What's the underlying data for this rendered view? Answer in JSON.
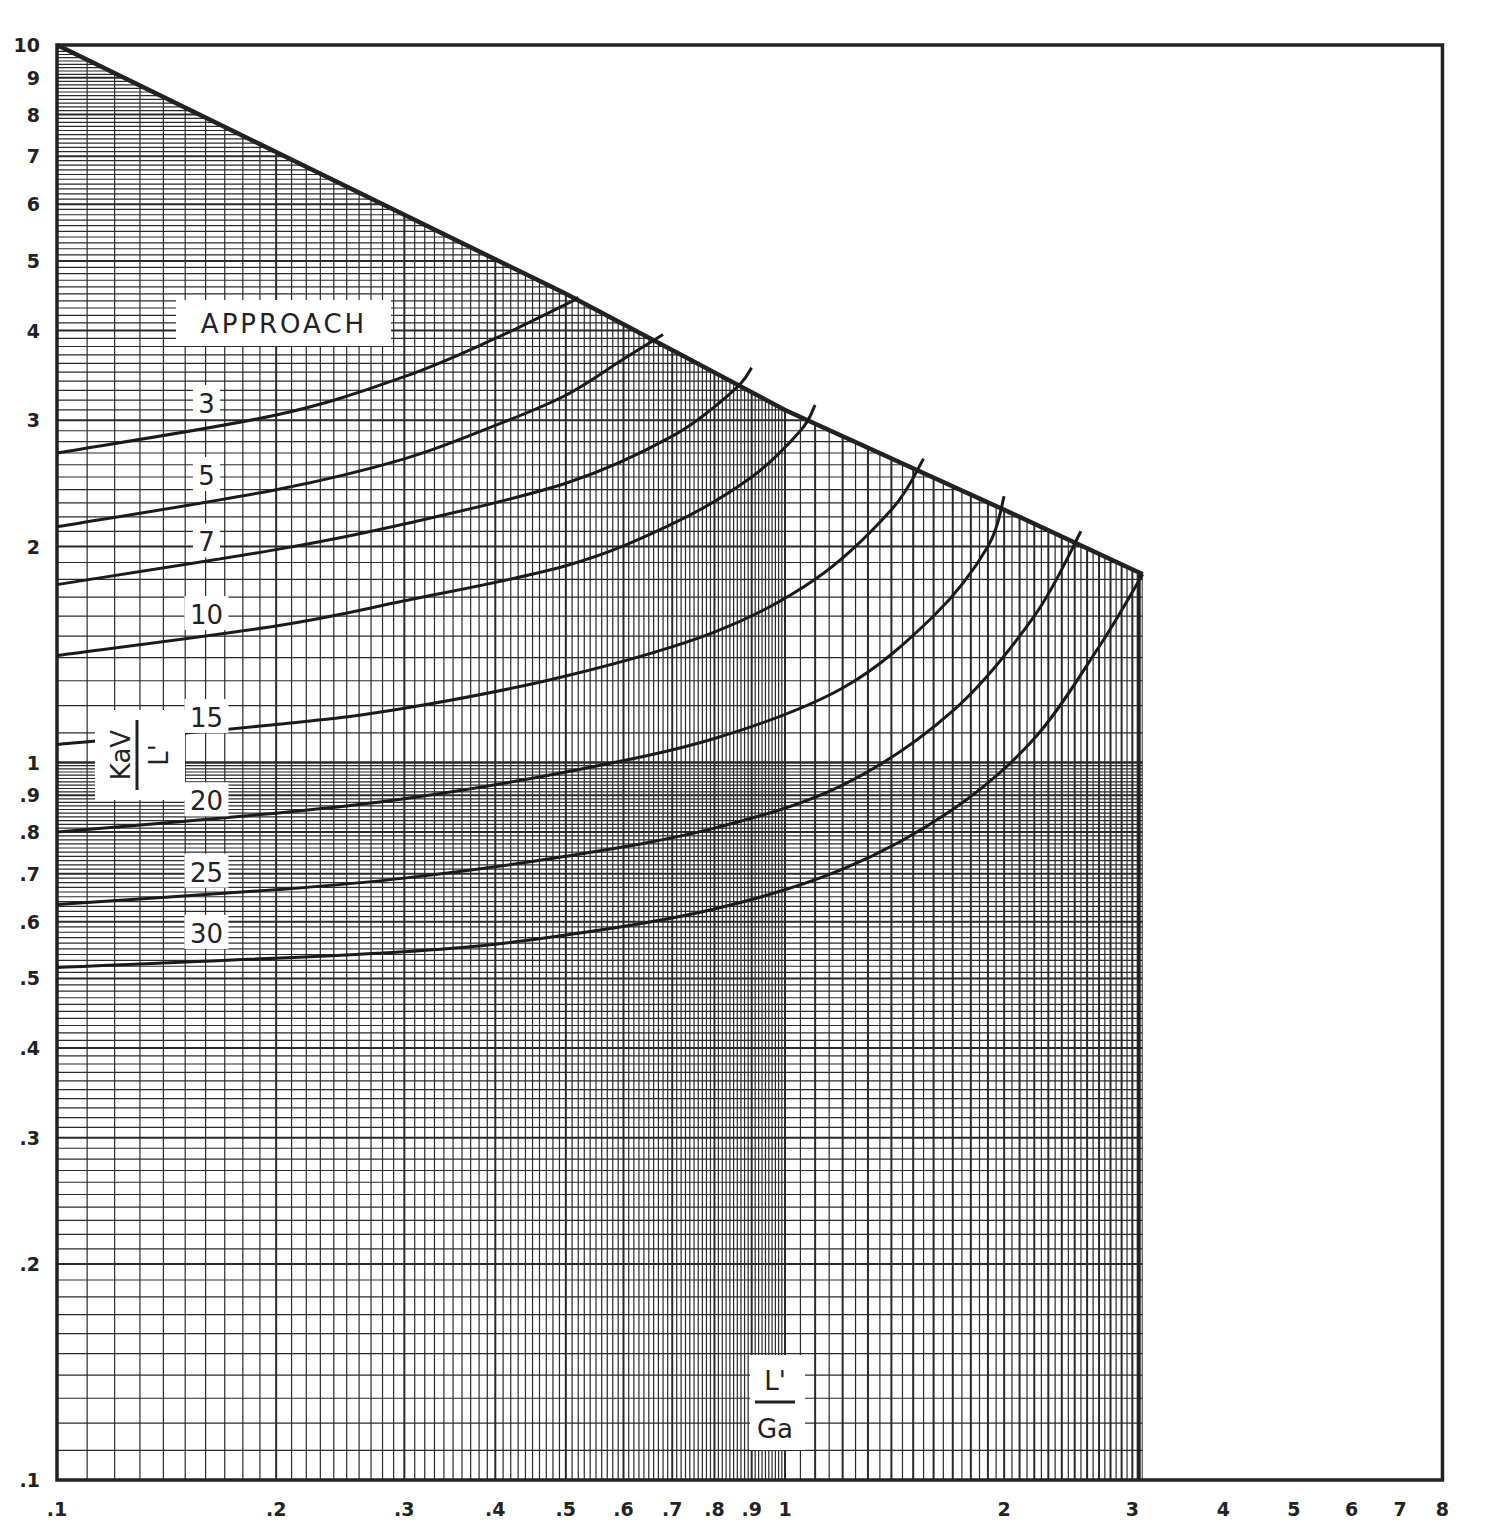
{
  "chart_data": {
    "type": "line",
    "title": "",
    "xlabel": "L'/Ga",
    "ylabel": "KaV/L'",
    "xscale": "log",
    "yscale": "log",
    "xlim": [
      0.1,
      8
    ],
    "ylim": [
      0.1,
      10
    ],
    "grid": true,
    "x_tick_labels": [
      ".1",
      ".2",
      ".3",
      ".4",
      ".5",
      ".6",
      ".7",
      ".8",
      ".9",
      "1",
      "2",
      "3",
      "4",
      "5",
      "6",
      "7",
      "8"
    ],
    "x_tick_values": [
      0.1,
      0.2,
      0.3,
      0.4,
      0.5,
      0.6,
      0.7,
      0.8,
      0.9,
      1,
      2,
      3,
      4,
      5,
      6,
      7,
      8
    ],
    "y_tick_labels": [
      ".1",
      ".2",
      ".3",
      ".4",
      ".5",
      ".6",
      ".7",
      ".8",
      ".9",
      "1",
      "2",
      "3",
      "4",
      "5",
      "6",
      "7",
      "8",
      "9",
      "10"
    ],
    "y_tick_values": [
      0.1,
      0.2,
      0.3,
      0.4,
      0.5,
      0.6,
      0.7,
      0.8,
      0.9,
      1,
      2,
      3,
      4,
      5,
      6,
      7,
      8,
      9,
      10
    ],
    "legend_title": "APPROACH",
    "boundary": {
      "name": "upper limit",
      "x": [
        0.1,
        0.5,
        1,
        2,
        3.1
      ],
      "y": [
        10,
        4.5,
        3.1,
        2.25,
        1.83
      ]
    },
    "series": [
      {
        "name": "3",
        "x": [
          0.1,
          0.2,
          0.3,
          0.4,
          0.5,
          0.52
        ],
        "y": [
          2.7,
          3.05,
          3.45,
          3.9,
          4.35,
          4.45
        ]
      },
      {
        "name": "5",
        "x": [
          0.1,
          0.2,
          0.3,
          0.4,
          0.5,
          0.6,
          0.68
        ],
        "y": [
          2.13,
          2.4,
          2.65,
          2.95,
          3.25,
          3.65,
          3.95
        ]
      },
      {
        "name": "7",
        "x": [
          0.1,
          0.2,
          0.3,
          0.5,
          0.7,
          0.85,
          0.9
        ],
        "y": [
          1.77,
          1.98,
          2.15,
          2.45,
          2.85,
          3.3,
          3.55
        ]
      },
      {
        "name": "10",
        "x": [
          0.1,
          0.2,
          0.3,
          0.5,
          0.7,
          0.9,
          1.05,
          1.1
        ],
        "y": [
          1.41,
          1.55,
          1.68,
          1.88,
          2.15,
          2.5,
          2.9,
          3.15
        ]
      },
      {
        "name": "15",
        "x": [
          0.1,
          0.2,
          0.3,
          0.5,
          0.8,
          1.1,
          1.4,
          1.55
        ],
        "y": [
          1.06,
          1.13,
          1.19,
          1.32,
          1.52,
          1.8,
          2.25,
          2.65
        ]
      },
      {
        "name": "20",
        "x": [
          0.1,
          0.2,
          0.3,
          0.5,
          0.8,
          1.2,
          1.6,
          1.9,
          2.0
        ],
        "y": [
          0.8,
          0.85,
          0.89,
          0.97,
          1.08,
          1.27,
          1.6,
          2.0,
          2.35
        ]
      },
      {
        "name": "25",
        "x": [
          0.1,
          0.2,
          0.3,
          0.5,
          0.8,
          1.2,
          1.7,
          2.2,
          2.55
        ],
        "y": [
          0.634,
          0.665,
          0.69,
          0.74,
          0.81,
          0.93,
          1.18,
          1.6,
          2.1
        ]
      },
      {
        "name": "30",
        "x": [
          0.1,
          0.3,
          0.5,
          0.8,
          1.2,
          1.7,
          2.2,
          2.7,
          3.1
        ],
        "y": [
          0.518,
          0.545,
          0.575,
          0.625,
          0.71,
          0.86,
          1.08,
          1.45,
          1.83
        ]
      }
    ],
    "series_label_positions": {
      "3": [
        0.153,
        3.15
      ],
      "5": [
        0.153,
        2.5
      ],
      "7": [
        0.153,
        2.02
      ],
      "10": [
        0.153,
        1.6
      ],
      "15": [
        0.153,
        1.15
      ],
      "20": [
        0.153,
        0.88
      ],
      "25": [
        0.153,
        0.7
      ],
      "30": [
        0.153,
        0.575
      ]
    }
  },
  "labels": {
    "approach": "APPROACH",
    "yaxis_num": "KaV",
    "yaxis_den": "L'",
    "xaxis_num": "L'",
    "xaxis_den": "Ga"
  }
}
